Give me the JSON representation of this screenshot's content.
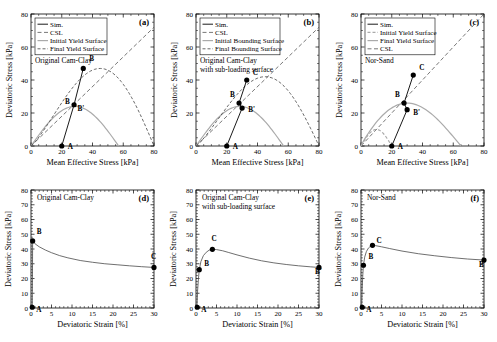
{
  "figure": {
    "axis_top": {
      "xlabel": "Mean Effective Stress [kPa]",
      "ylabel": "Deviatoric Stress [kPa]",
      "xticks": [
        "0",
        "20",
        "40",
        "60",
        "80"
      ],
      "yticks": [
        "0",
        "20",
        "40",
        "60",
        "80"
      ],
      "xlim": [
        0,
        80
      ],
      "ylim": [
        0,
        80
      ]
    },
    "axis_bottom": {
      "xlabel": "Deviatoric Strain [%]",
      "ylabel": "Deviatoric Stress [kPa]",
      "xticks": [
        "0",
        "5",
        "10",
        "15",
        "20",
        "25",
        "30"
      ],
      "yticks": [
        "0",
        "10",
        "20",
        "30",
        "40",
        "50",
        "60",
        "70",
        "80"
      ],
      "xlim": [
        0,
        30
      ],
      "ylim": [
        0,
        80
      ]
    },
    "colors": {
      "sim": "#000000",
      "csl": "#555555",
      "initial_surface": "#aaaaaa",
      "final_surface": "#444444",
      "axis": "#000000"
    }
  },
  "panels": [
    {
      "id": "a",
      "label": "(a)",
      "model": "Original Cam-Clay",
      "model_line2": "",
      "legend": [
        "Sim.",
        "CSL",
        "Initial Yield Surface",
        "Final Yield Surface"
      ],
      "points": [
        {
          "name": "A",
          "x": 20,
          "y": 0,
          "lx": 6,
          "ly": -3
        },
        {
          "name": "B",
          "x": 34,
          "y": 47,
          "lx": 6,
          "ly": 7
        }
      ],
      "mid_point": {
        "x": 28,
        "y": 25
      },
      "mid_labels": [
        "B",
        "B'"
      ],
      "csl_slope": 0.9,
      "initial_surface": {
        "p0": 57,
        "qmax": 24,
        "pmax": 28.5
      },
      "final_surface": {
        "p0": 80,
        "qmax": 47,
        "pmax": 45
      }
    },
    {
      "id": "b",
      "label": "(b)",
      "model": "Original Cam-Clay",
      "model_line2": "with sub-loading surface",
      "legend": [
        "Sim.",
        "CSL",
        "Initial Bounding Surface",
        "Final Bounding Surface"
      ],
      "points": [
        {
          "name": "A",
          "x": 20,
          "y": 0,
          "lx": 6,
          "ly": -3
        },
        {
          "name": "B",
          "x": 28,
          "y": 26,
          "lx": -9,
          "ly": 6
        },
        {
          "name": "B'",
          "x": 30,
          "y": 23,
          "lx": 6,
          "ly": -4
        },
        {
          "name": "C",
          "x": 33,
          "y": 40,
          "lx": 6,
          "ly": 5
        }
      ],
      "csl_slope": 0.9,
      "initial_surface": {
        "p0": 57,
        "qmax": 24,
        "pmax": 28.5
      },
      "final_surface": {
        "p0": 80,
        "qmax": 42,
        "pmax": 45
      }
    },
    {
      "id": "c",
      "label": "(c)",
      "model": "Nor-Sand",
      "model_line2": "",
      "legend": [
        "Sim.",
        "Initial Yield Surface",
        "Final Yield Surface",
        "CSL"
      ],
      "points": [
        {
          "name": "A",
          "x": 20,
          "y": 0,
          "lx": 6,
          "ly": -3
        },
        {
          "name": "B",
          "x": 28,
          "y": 26,
          "lx": -9,
          "ly": 6
        },
        {
          "name": "B'",
          "x": 30,
          "y": 22,
          "lx": 6,
          "ly": -5
        },
        {
          "name": "C",
          "x": 34,
          "y": 43,
          "lx": 6,
          "ly": 5
        }
      ],
      "csl_slope": 1.0,
      "initial_surface": {
        "p0": 20,
        "qmax": 10,
        "pmax": 10
      },
      "final_surface": {
        "p0": 65,
        "qmax": 26,
        "pmax": 30
      }
    },
    {
      "id": "d",
      "label": "(d)",
      "model": "Original Cam-Clay",
      "model_line2": "",
      "points": [
        {
          "name": "A",
          "x": 0.3,
          "y": 0.5,
          "lx": 4,
          "ly": -5
        },
        {
          "name": "B",
          "x": 0.4,
          "y": 45.5,
          "lx": 4,
          "ly": 7
        },
        {
          "name": "C",
          "x": 30,
          "y": 27.5,
          "lx": -3,
          "ly": 8
        }
      ],
      "curve": [
        [
          0.3,
          0.0
        ],
        [
          0.35,
          20.0
        ],
        [
          0.4,
          45.5
        ],
        [
          1.0,
          43.5
        ],
        [
          2.0,
          41.5
        ],
        [
          3.5,
          39.3
        ],
        [
          5.0,
          37.5
        ],
        [
          7.0,
          35.5
        ],
        [
          9.0,
          34.0
        ],
        [
          12.0,
          32.2
        ],
        [
          15.0,
          31.0
        ],
        [
          18.0,
          30.0
        ],
        [
          21.0,
          29.3
        ],
        [
          24.0,
          28.6
        ],
        [
          27.0,
          28.0
        ],
        [
          30.0,
          27.5
        ]
      ]
    },
    {
      "id": "e",
      "label": "(e)",
      "model": "Original Cam-Clay",
      "model_line2": "with sub-loading surface",
      "points": [
        {
          "name": "A",
          "x": 0.3,
          "y": 0.5,
          "lx": 4,
          "ly": -5
        },
        {
          "name": "B",
          "x": 0.8,
          "y": 26.0,
          "lx": 5,
          "ly": 4
        },
        {
          "name": "C",
          "x": 4.0,
          "y": 39.8,
          "lx": -1,
          "ly": 8
        },
        {
          "name": "B'",
          "x": 30,
          "y": 27.5,
          "lx": -4,
          "ly": -7
        }
      ],
      "curve": [
        [
          0.2,
          0.0
        ],
        [
          0.4,
          12.0
        ],
        [
          0.6,
          20.0
        ],
        [
          0.8,
          26.0
        ],
        [
          1.2,
          31.5
        ],
        [
          1.8,
          35.5
        ],
        [
          2.5,
          37.8
        ],
        [
          3.2,
          39.2
        ],
        [
          4.0,
          39.8
        ],
        [
          5.0,
          39.6
        ],
        [
          6.5,
          38.8
        ],
        [
          8.0,
          37.6
        ],
        [
          10.0,
          36.0
        ],
        [
          13.0,
          33.8
        ],
        [
          16.0,
          32.0
        ],
        [
          19.0,
          30.6
        ],
        [
          22.0,
          29.5
        ],
        [
          25.0,
          28.6
        ],
        [
          28.0,
          27.9
        ],
        [
          30.0,
          27.5
        ]
      ]
    },
    {
      "id": "f",
      "label": "(f)",
      "model": "Nor-Sand",
      "model_line2": "",
      "points": [
        {
          "name": "A",
          "x": 0.3,
          "y": 0.5,
          "lx": 4,
          "ly": -5
        },
        {
          "name": "B",
          "x": 0.6,
          "y": 29.0,
          "lx": 5,
          "ly": 6
        },
        {
          "name": "C",
          "x": 2.8,
          "y": 42.5,
          "lx": 4,
          "ly": 2
        },
        {
          "name": "B'",
          "x": 30,
          "y": 32.5,
          "lx": -5,
          "ly": -7
        }
      ],
      "curve": [
        [
          0.15,
          0.0
        ],
        [
          0.3,
          14.0
        ],
        [
          0.45,
          23.0
        ],
        [
          0.6,
          29.0
        ],
        [
          0.9,
          34.5
        ],
        [
          1.3,
          38.2
        ],
        [
          1.8,
          40.6
        ],
        [
          2.3,
          41.9
        ],
        [
          2.8,
          42.5
        ],
        [
          3.5,
          42.3
        ],
        [
          5.0,
          41.5
        ],
        [
          7.0,
          40.3
        ],
        [
          10.0,
          38.6
        ],
        [
          14.0,
          36.8
        ],
        [
          18.0,
          35.4
        ],
        [
          22.0,
          34.2
        ],
        [
          26.0,
          33.2
        ],
        [
          30.0,
          32.5
        ]
      ]
    }
  ]
}
